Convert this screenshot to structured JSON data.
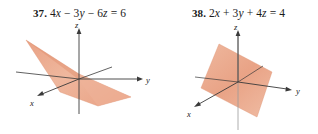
{
  "page": {
    "background": "#ffffff",
    "width": 318,
    "height": 134
  },
  "colors": {
    "plane_fill": "#eaa98c",
    "plane_fill_light": "#f0bda4",
    "plane_edge": "#d98a68",
    "axis": "#3a3a3a",
    "text": "#1a1a1a"
  },
  "problems": [
    {
      "id": "37",
      "number": "37.",
      "equation": "4x − 3y − 6z = 6",
      "equation_parts": [
        {
          "text": "4",
          "italic": false
        },
        {
          "text": "x",
          "italic": true
        },
        {
          "text": " − 3",
          "italic": false
        },
        {
          "text": "y",
          "italic": true
        },
        {
          "text": " − 6",
          "italic": false
        },
        {
          "text": "z",
          "italic": true
        },
        {
          "text": " = 6",
          "italic": false
        }
      ],
      "figure": {
        "type": "plane-3d",
        "axes": [
          {
            "name": "x",
            "label": "x"
          },
          {
            "name": "y",
            "label": "y"
          },
          {
            "name": "z",
            "label": "z"
          }
        ],
        "description": "Shallow plane through origin tilted steeply, cutting all three axes"
      }
    },
    {
      "id": "38",
      "number": "38.",
      "equation": "2x + 3y + 4z = 4",
      "equation_parts": [
        {
          "text": "2",
          "italic": false
        },
        {
          "text": "x",
          "italic": true
        },
        {
          "text": " + 3",
          "italic": false
        },
        {
          "text": "y",
          "italic": true
        },
        {
          "text": " + 4",
          "italic": false
        },
        {
          "text": "z",
          "italic": true
        },
        {
          "text": " = 4",
          "italic": false
        }
      ],
      "figure": {
        "type": "plane-3d",
        "axes": [
          {
            "name": "x",
            "label": "x"
          },
          {
            "name": "y",
            "label": "y"
          },
          {
            "name": "z",
            "label": "z"
          }
        ],
        "description": "Diamond-shaped plane centered on origin intersecting all three axes"
      }
    }
  ]
}
